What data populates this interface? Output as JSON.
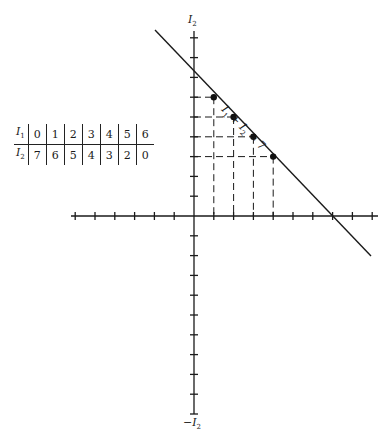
{
  "figure": {
    "y_axis_label_top": "I",
    "y_axis_label_top_sub": "2",
    "y_axis_label_bottom": "−I",
    "y_axis_label_bottom_sub": "2",
    "line_label_parts": {
      "a": "I",
      "a_sub": "1",
      "op": " + ",
      "b": "I",
      "b_sub": "2",
      "rhs": " = 7"
    }
  },
  "table": {
    "row1_label": "I",
    "row1_sub": "1",
    "row2_label": "I",
    "row2_sub": "2",
    "row1": [
      "0",
      "1",
      "2",
      "3",
      "4",
      "5",
      "6"
    ],
    "row2": [
      "7",
      "6",
      "5",
      "4",
      "3",
      "2",
      "0"
    ]
  },
  "chart_data": {
    "type": "line",
    "title": "",
    "equation": "I1 + I2 = 7",
    "xlabel": "",
    "ylabel": "I2",
    "ylabel_negative": "-I2",
    "line": {
      "x": [
        -2,
        9
      ],
      "y": [
        9,
        -2
      ]
    },
    "highlighted_points": [
      {
        "x": 1,
        "y": 6
      },
      {
        "x": 2,
        "y": 5
      },
      {
        "x": 3,
        "y": 4
      },
      {
        "x": 4,
        "y": 3
      }
    ],
    "dashed_projections": true,
    "x_ticks": [
      -6,
      -5,
      -4,
      -3,
      -2,
      -1,
      1,
      2,
      3,
      4,
      5,
      6,
      7,
      8,
      9
    ],
    "y_ticks": [
      -10,
      -9,
      -8,
      -7,
      -6,
      -5,
      -4,
      -3,
      -2,
      -1,
      1,
      2,
      3,
      4,
      5,
      6,
      7,
      8,
      9
    ],
    "grid": false,
    "table": {
      "I1": [
        0,
        1,
        2,
        3,
        4,
        5,
        6
      ],
      "I2": [
        7,
        6,
        5,
        4,
        3,
        2,
        0
      ]
    }
  }
}
